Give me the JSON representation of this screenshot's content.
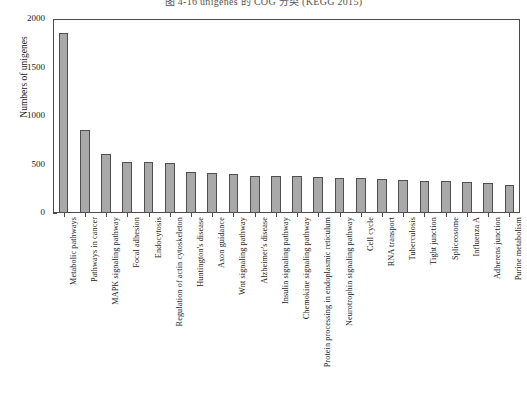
{
  "figure": {
    "caption": "图 4-16  unigenes 的 COG 分类 (KEGG 2015)"
  },
  "chart_data": {
    "type": "bar",
    "title": "",
    "xlabel": "",
    "ylabel": "Numbers of unigenes",
    "ylim": [
      0,
      2000
    ],
    "yticks": [
      0,
      500,
      1000,
      1500,
      2000
    ],
    "ytick_labels": [
      "0",
      "500",
      "1000",
      "1500",
      "2000"
    ],
    "grid": false,
    "legend": null,
    "bar_color": "#a9a9a9",
    "bar_edge_color": "#4f4f4f",
    "categories": [
      "Metabolic pathways",
      "Pathways in cancer",
      "MAPK signaling pathway",
      "Focal adhesion",
      "Endocytosis",
      "Regulation of actin cytoskeleton",
      "Huntington's disease",
      "Axon guidance",
      "Wnt signaling pathway",
      "Alzheimer's disease",
      "Insulin signaling pathway",
      "Chemokine signaling pathway",
      "Protein processing in endoplasmic reticulum",
      "Neurotrophin signaling pathway",
      "Cell cycle",
      "RNA transport",
      "Tuberculosis",
      "Tight junction",
      "Spliceosome",
      "Influenza A",
      "Adherens junction",
      "Purine metabolism"
    ],
    "values": [
      1860,
      855,
      610,
      530,
      530,
      520,
      420,
      415,
      405,
      385,
      380,
      380,
      370,
      365,
      360,
      350,
      345,
      330,
      325,
      320,
      305,
      290
    ]
  }
}
